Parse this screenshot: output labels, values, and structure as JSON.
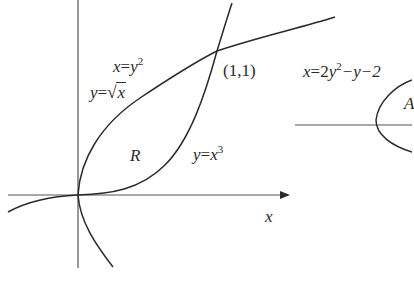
{
  "figure": {
    "left_panel": {
      "x_axis_label": "x",
      "region_label": "R",
      "point_label": "(1,1)",
      "curves": [
        {
          "name": "parabola",
          "label_lhs": "x",
          "label_eq": "=",
          "label_base": "y",
          "label_exp": "2",
          "alt_lhs": "y",
          "alt_eq": "=",
          "alt_radicand": "x"
        },
        {
          "name": "cubic",
          "label_lhs": "y",
          "label_eq": "=",
          "label_base": "x",
          "label_exp": "3"
        }
      ]
    },
    "right_panel": {
      "curve_label_lhs": "x",
      "curve_label_eq": "=2",
      "curve_label_base": "y",
      "curve_label_exp": "2",
      "curve_label_rest": "−y−2",
      "region_label": "A"
    },
    "colors": {
      "ink": "#2a2a2a",
      "axis": "#555555",
      "background": "#ffffff"
    }
  }
}
